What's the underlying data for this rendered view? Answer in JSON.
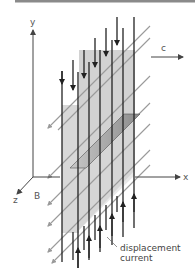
{
  "figure": {
    "type": "electromagnetic-wave-diagram",
    "top_rule_color": "#8a8a8a",
    "colors": {
      "axis": "#555555",
      "current_lines": "#222222",
      "b_field_lines": "#9a9a9a",
      "panel_fill": "#d6d6d6",
      "slab_fill": "#a8a8a8"
    }
  },
  "axes": {
    "y_label": "y",
    "x_label": "x",
    "z_label": "z"
  },
  "labels": {
    "propagation": "c",
    "magnetic_field": "B",
    "annotation_line1": "displacement",
    "annotation_line2": "current"
  }
}
